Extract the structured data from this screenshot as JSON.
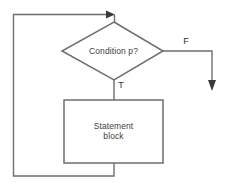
{
  "diagram": {
    "type": "flowchart",
    "colors": {
      "background": "#ffffff",
      "shape_stroke": "#6e6e6e",
      "connector_stroke": "#6e6e6e",
      "arrow_fill": "#3a3a3a",
      "text": "#3d3d3d"
    },
    "nodes": [
      {
        "id": "condition",
        "shape": "diamond",
        "label": "Condition p?"
      },
      {
        "id": "statement",
        "shape": "rectangle",
        "label": "Statement\nblock"
      }
    ],
    "edges": [
      {
        "id": "entry",
        "from": "loop-back",
        "to": "condition",
        "label": "",
        "arrow": "right"
      },
      {
        "id": "true-branch",
        "from": "condition",
        "to": "statement",
        "label": "T",
        "arrow": "none"
      },
      {
        "id": "false-branch",
        "from": "condition",
        "to": "exit",
        "label": "F",
        "arrow": "down"
      },
      {
        "id": "loop-back",
        "from": "statement",
        "to": "condition",
        "label": "",
        "arrow": "none"
      }
    ]
  }
}
